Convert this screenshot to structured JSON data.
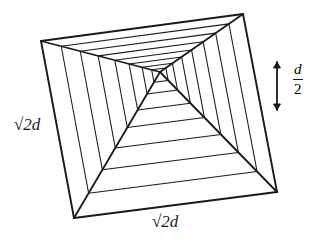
{
  "figure": {
    "background": "#ffffff",
    "stroke_color": "#1a1a1a",
    "width": 328,
    "height": 250
  },
  "labels": {
    "left_side": {
      "radical": "√",
      "radicand": "2",
      "symbol": "d",
      "text": "√2d"
    },
    "bottom_side": {
      "radical": "√",
      "radicand": "2",
      "symbol": "d",
      "text": "√2d"
    },
    "depth": {
      "numerator": "d",
      "denominator": "2",
      "text": "d/2"
    }
  },
  "chart_data": {
    "type": "diagram",
    "projection": "oblique perspective, viewed from above",
    "outer_quad": [
      [
        41,
        41
      ],
      [
        243,
        14
      ],
      [
        277,
        192
      ],
      [
        74,
        218
      ]
    ],
    "apex": [
      160,
      72
    ],
    "ring_fractions": [
      0.17,
      0.33,
      0.48,
      0.62,
      0.74,
      0.85,
      0.93
    ],
    "ridge_lines": 4,
    "annotations": [
      {
        "name": "left-edge-length",
        "text": "√2d",
        "x": 28,
        "y": 127
      },
      {
        "name": "bottom-edge-length",
        "text": "√2d",
        "x": 172,
        "y": 224
      },
      {
        "name": "depth-measure",
        "text": "d/2",
        "x": 300,
        "y": 86
      }
    ],
    "depth_arrow": {
      "x": 277,
      "y1": 62,
      "y2": 110,
      "double_headed": true
    }
  }
}
